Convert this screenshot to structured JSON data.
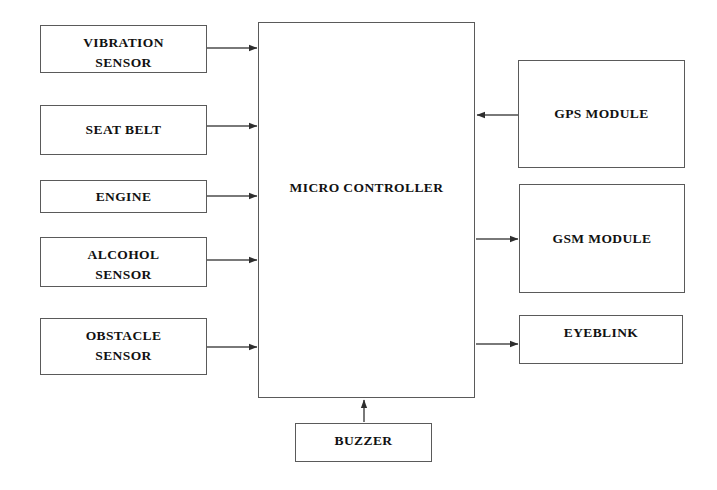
{
  "diagram": {
    "canvas": {
      "width": 717,
      "height": 490,
      "background": "#ffffff"
    },
    "style": {
      "border_color": "#5a5a5a",
      "line_color": "#4d4d4d",
      "text_color": "#111111"
    },
    "nodes": {
      "vibration_sensor": {
        "label": "VIBRATION\nSENSOR",
        "x": 40,
        "y": 25,
        "w": 167,
        "h": 48
      },
      "seat_belt": {
        "label": "SEAT BELT",
        "x": 40,
        "y": 105,
        "w": 167,
        "h": 50
      },
      "engine": {
        "label": "ENGINE",
        "x": 40,
        "y": 180,
        "w": 167,
        "h": 33
      },
      "alcohol_sensor": {
        "label": "ALCOHOL\nSENSOR",
        "x": 40,
        "y": 237,
        "w": 167,
        "h": 50
      },
      "obstacle_sensor": {
        "label": "OBSTACLE\nSENSOR",
        "x": 40,
        "y": 318,
        "w": 167,
        "h": 57
      },
      "micro_controller": {
        "label": "MICRO CONTROLLER",
        "x": 258,
        "y": 22,
        "w": 217,
        "h": 376
      },
      "gps_module": {
        "label": "GPS MODULE",
        "x": 518,
        "y": 60,
        "w": 167,
        "h": 108
      },
      "gsm_module": {
        "label": "GSM MODULE",
        "x": 519,
        "y": 184,
        "w": 166,
        "h": 109
      },
      "eyeblink": {
        "label": "EYEBLINK",
        "x": 519,
        "y": 315,
        "w": 164,
        "h": 49
      },
      "buzzer": {
        "label": "BUZZER",
        "x": 295,
        "y": 423,
        "w": 137,
        "h": 39
      }
    },
    "connections": [
      {
        "name": "vibration-sensor-to-micro-controller",
        "from": "vibration_sensor",
        "to": "micro_controller",
        "direction": "right"
      },
      {
        "name": "seat-belt-to-micro-controller",
        "from": "seat_belt",
        "to": "micro_controller",
        "direction": "right"
      },
      {
        "name": "engine-to-micro-controller",
        "from": "engine",
        "to": "micro_controller",
        "direction": "right"
      },
      {
        "name": "alcohol-sensor-to-micro-controller",
        "from": "alcohol_sensor",
        "to": "micro_controller",
        "direction": "right"
      },
      {
        "name": "obstacle-sensor-to-micro-controller",
        "from": "obstacle_sensor",
        "to": "micro_controller",
        "direction": "right"
      },
      {
        "name": "gps-module-to-micro-controller",
        "from": "gps_module",
        "to": "micro_controller",
        "direction": "left"
      },
      {
        "name": "micro-controller-to-gsm-module",
        "from": "micro_controller",
        "to": "gsm_module",
        "direction": "right"
      },
      {
        "name": "micro-controller-to-eyeblink",
        "from": "micro_controller",
        "to": "eyeblink",
        "direction": "right"
      },
      {
        "name": "buzzer-to-micro-controller",
        "from": "buzzer",
        "to": "micro_controller",
        "direction": "up"
      }
    ]
  }
}
